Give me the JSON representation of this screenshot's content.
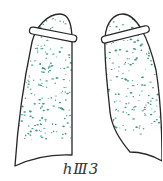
{
  "figure": {
    "label": "hⅢ3",
    "dot_color": "#3a9a7a",
    "line_color": "#262626",
    "lungs": [
      {
        "name": "left-lung",
        "opacity_distribution": "upper, middle and lower zones"
      },
      {
        "name": "right-lung",
        "opacity_distribution": "upper, middle and lower zones"
      }
    ]
  }
}
